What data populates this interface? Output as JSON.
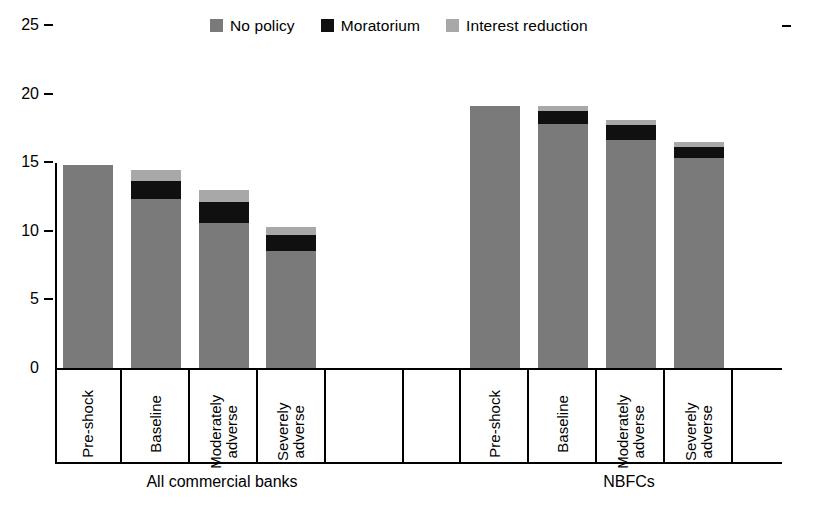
{
  "chart_data": {
    "type": "bar",
    "stacked": true,
    "title": "",
    "subtitle": "",
    "xlabel": "",
    "ylabel": "",
    "ylim": [
      0,
      25
    ],
    "yticks": [
      0,
      5,
      10,
      15,
      20,
      25
    ],
    "ytick_labels": [
      "0",
      "5",
      "10",
      "15",
      "20",
      "25"
    ],
    "grid": false,
    "legend_position": "top-center",
    "legend": [
      "No policy",
      "Moratorium",
      "Interest reduction"
    ],
    "colors": {
      "no_policy": "#7a7a7a",
      "moratorium": "#101010",
      "interest_reduction": "#a8a8a8",
      "axis": "#000000",
      "background": "#ffffff"
    },
    "groups": [
      {
        "name": "All commercial banks",
        "categories": [
          "Pre-shock",
          "Baseline",
          "Moderately adverse",
          "Severely adverse"
        ]
      },
      {
        "name": "NBFCs",
        "categories": [
          "Pre-shock",
          "Baseline",
          "Moderately adverse",
          "Severely adverse"
        ]
      }
    ],
    "categories": [
      "Pre-shock",
      "Baseline",
      "Moderately adverse",
      "Severely adverse",
      "Pre-shock",
      "Baseline",
      "Moderately adverse",
      "Severely adverse"
    ],
    "series": [
      {
        "name": "No policy",
        "color": "#7a7a7a",
        "values": [
          14.8,
          12.3,
          10.6,
          8.5,
          19.1,
          17.8,
          16.6,
          15.3
        ]
      },
      {
        "name": "Moratorium",
        "color": "#101010",
        "values": [
          0.0,
          1.3,
          1.5,
          1.2,
          0.0,
          0.9,
          1.1,
          0.8
        ]
      },
      {
        "name": "Interest reduction",
        "color": "#a8a8a8",
        "values": [
          0.0,
          0.8,
          0.9,
          0.6,
          0.0,
          0.4,
          0.4,
          0.4
        ]
      }
    ],
    "totals": [
      14.8,
      14.4,
      13.0,
      10.3,
      19.1,
      19.1,
      18.1,
      16.5
    ]
  }
}
